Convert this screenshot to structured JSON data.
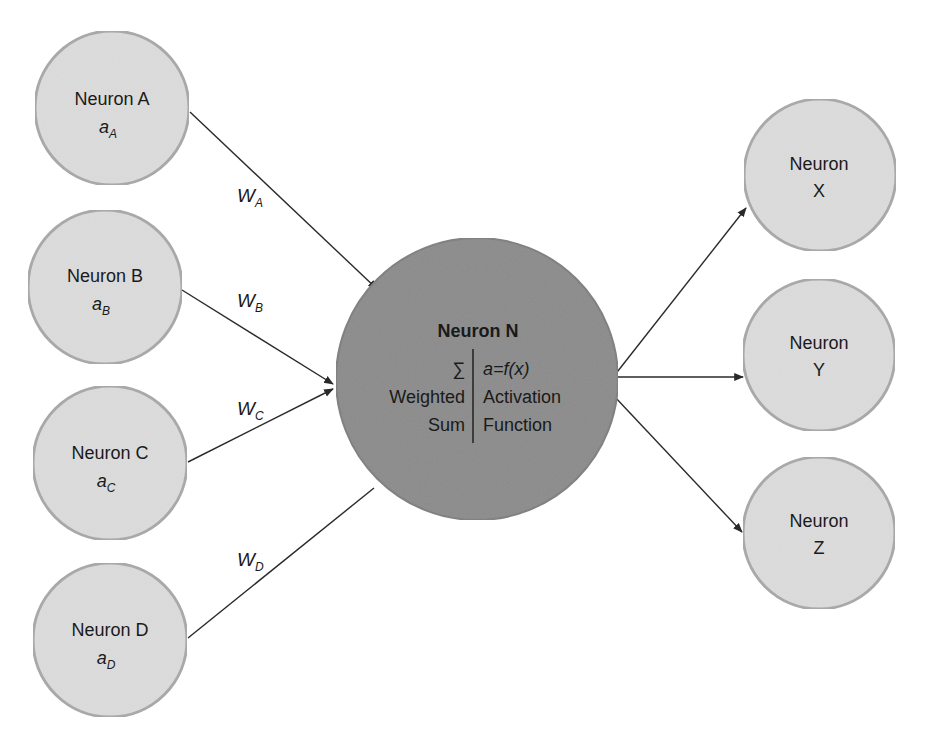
{
  "diagram": {
    "type": "neural-network-neuron",
    "colors": {
      "background": "#ffffff",
      "io_node_fill": "#dcdcdc",
      "io_node_stroke": "#a8a8a8",
      "central_node_fill": "#8c8c8c",
      "central_node_stroke": "#7a7a7a",
      "edge": "#2a2a2a",
      "text": "#1a1a1a"
    },
    "inputs": [
      {
        "id": "A",
        "label": "Neuron A",
        "activation": "a",
        "activation_sub": "A",
        "weight": "W",
        "weight_sub": "A"
      },
      {
        "id": "B",
        "label": "Neuron B",
        "activation": "a",
        "activation_sub": "B",
        "weight": "W",
        "weight_sub": "B"
      },
      {
        "id": "C",
        "label": "Neuron C",
        "activation": "a",
        "activation_sub": "C",
        "weight": "W",
        "weight_sub": "C"
      },
      {
        "id": "D",
        "label": "Neuron D",
        "activation": "a",
        "activation_sub": "D",
        "weight": "W",
        "weight_sub": "D"
      }
    ],
    "central": {
      "title": "Neuron N",
      "left_col": {
        "symbol": "∑",
        "line1": "Weighted",
        "line2": "Sum"
      },
      "right_col": {
        "formula": "a=f(x)",
        "line1": "Activation",
        "line2": "Function"
      }
    },
    "outputs": [
      {
        "id": "X",
        "line1": "Neuron",
        "line2": "X"
      },
      {
        "id": "Y",
        "line1": "Neuron",
        "line2": "Y"
      },
      {
        "id": "Z",
        "line1": "Neuron",
        "line2": "Z"
      }
    ]
  }
}
